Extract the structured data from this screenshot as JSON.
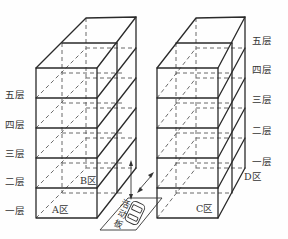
{
  "figure": {
    "left_building": {
      "floor_labels": [
        "五层",
        "四层",
        "三层",
        "二层",
        "一层"
      ],
      "zones": {
        "front": "A区",
        "back": "B区"
      }
    },
    "right_building": {
      "floor_labels": [
        "五层",
        "四层",
        "三层",
        "二层",
        "一层"
      ],
      "zones": {
        "front": "C区",
        "back": "D区"
      }
    },
    "platform": {
      "label_chars": [
        "活",
        "动",
        "板"
      ]
    },
    "colors": {
      "line": "#2a2a2a",
      "dashed": "#5a5a5a",
      "background": "#fefefe"
    }
  }
}
